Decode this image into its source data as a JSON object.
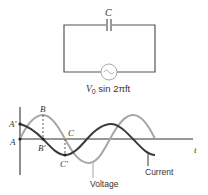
{
  "circuit": {
    "capacitor_label": "C",
    "source_label_prefix": "V",
    "source_label_sub": "0",
    "source_label_suffix": " sin 2πft"
  },
  "graph": {
    "axis_label_t": "t",
    "point_labels": {
      "A": "A",
      "A_prime": "A′",
      "B": "B",
      "B_prime": "B′",
      "C": "C",
      "C_prime": "C′"
    },
    "curve_labels": {
      "voltage": "Voltage",
      "current": "Current"
    },
    "colors": {
      "voltage": "#a6a6a6",
      "current": "#3a3a3a",
      "axis": "#333333",
      "wire": "#555555"
    }
  }
}
